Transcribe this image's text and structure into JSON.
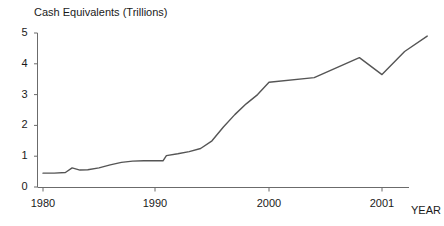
{
  "chart_data": {
    "type": "line",
    "title": "Cash Equivalents (Trillions)",
    "xlabel": "YEAR",
    "ylabel": "",
    "ylim": [
      0,
      5
    ],
    "xlim": [
      1980,
      2001.6
    ],
    "grid": false,
    "legend": null,
    "y_ticks": [
      "0",
      "1",
      "2",
      "3",
      "4",
      "5"
    ],
    "y_tick_values": [
      0,
      1,
      2,
      3,
      4,
      5
    ],
    "x_ticks": [
      "1980",
      "1990",
      "2000",
      "2001"
    ],
    "x_tick_values": [
      1980,
      1990,
      2000,
      2001
    ],
    "series": [
      {
        "name": "Cash Equivalents",
        "color": "#555555",
        "x": [
          1980,
          1981,
          1982,
          1982.6,
          1983.3,
          1984,
          1985,
          1986,
          1987,
          1988,
          1989,
          1990,
          1990.7,
          1991,
          1992,
          1993,
          1994,
          1995,
          1996,
          1997,
          1998,
          1999,
          2000,
          2000.4,
          2000.8,
          2001,
          2001.2,
          2001.4
        ],
        "values": [
          0.45,
          0.45,
          0.47,
          0.62,
          0.55,
          0.56,
          0.62,
          0.72,
          0.8,
          0.84,
          0.85,
          0.85,
          0.85,
          1.02,
          1.08,
          1.15,
          1.25,
          1.5,
          1.95,
          2.35,
          2.7,
          3.0,
          3.4,
          3.55,
          4.2,
          3.65,
          4.4,
          4.9
        ]
      }
    ]
  },
  "axis": {
    "year_label": "YEAR"
  }
}
